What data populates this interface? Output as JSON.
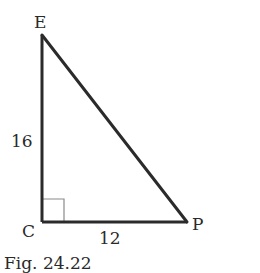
{
  "figure": {
    "type": "right-triangle",
    "vertices": {
      "E": {
        "label": "E",
        "x": 42,
        "y": 35
      },
      "C": {
        "label": "C",
        "x": 42,
        "y": 222
      },
      "P": {
        "label": "P",
        "x": 187,
        "y": 222
      }
    },
    "sides": {
      "EC": {
        "label": "16"
      },
      "CP": {
        "label": "12"
      }
    },
    "right_angle_at": "C",
    "caption": "Fig. 24.22"
  }
}
